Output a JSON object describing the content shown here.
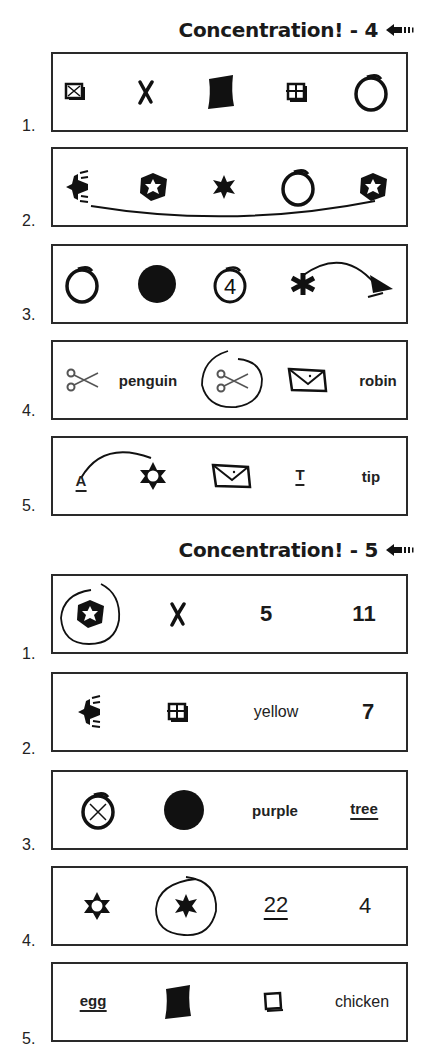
{
  "sections": [
    {
      "title": "Concentration! - 4",
      "arrow_icon": "left-arrow-icon",
      "rows": [
        {
          "number": "1.",
          "items": [
            {
              "type": "icon",
              "name": "crossed-box-icon"
            },
            {
              "type": "icon",
              "name": "x-mark-icon"
            },
            {
              "type": "icon",
              "name": "filled-square-icon"
            },
            {
              "type": "icon",
              "name": "window-grid-icon"
            },
            {
              "type": "icon",
              "name": "open-circle-icon"
            }
          ]
        },
        {
          "number": "2.",
          "items": [
            {
              "type": "icon",
              "name": "airplane-icon"
            },
            {
              "type": "icon",
              "name": "hexagon-star-icon"
            },
            {
              "type": "icon",
              "name": "filled-star-icon"
            },
            {
              "type": "icon",
              "name": "open-circle-icon"
            },
            {
              "type": "icon",
              "name": "hexagon-star-icon"
            }
          ],
          "annotation": "line connecting airplane to hexagon-star"
        },
        {
          "number": "3.",
          "items": [
            {
              "type": "icon",
              "name": "open-circle-icon"
            },
            {
              "type": "icon",
              "name": "filled-circle-icon"
            },
            {
              "type": "text",
              "value": "4",
              "circled": true
            },
            {
              "type": "icon",
              "name": "asterisk-icon"
            },
            {
              "type": "icon",
              "name": "triangle-icon"
            }
          ],
          "annotation": "arrow from asterisk to triangle"
        },
        {
          "number": "4.",
          "items": [
            {
              "type": "icon",
              "name": "scissors-icon"
            },
            {
              "type": "text",
              "value": "penguin"
            },
            {
              "type": "icon",
              "name": "scissors-icon",
              "circled": true
            },
            {
              "type": "icon",
              "name": "envelope-icon"
            },
            {
              "type": "text",
              "value": "robin",
              "struck": "i"
            }
          ]
        },
        {
          "number": "5.",
          "items": [
            {
              "type": "text",
              "value": "A",
              "underlined": true
            },
            {
              "type": "icon",
              "name": "outline-star-icon"
            },
            {
              "type": "icon",
              "name": "envelope-icon"
            },
            {
              "type": "text",
              "value": "T",
              "underlined": true
            },
            {
              "type": "text",
              "value": "tip"
            }
          ],
          "annotation": "arc connecting A to star"
        }
      ]
    },
    {
      "title": "Concentration! - 5",
      "arrow_icon": "left-arrow-icon",
      "rows": [
        {
          "number": "1.",
          "items": [
            {
              "type": "icon",
              "name": "hexagon-star-icon",
              "circled": true
            },
            {
              "type": "icon",
              "name": "x-mark-icon"
            },
            {
              "type": "text",
              "value": "5"
            },
            {
              "type": "text",
              "value": "11"
            }
          ]
        },
        {
          "number": "2.",
          "items": [
            {
              "type": "icon",
              "name": "airplane-icon"
            },
            {
              "type": "icon",
              "name": "window-grid-icon"
            },
            {
              "type": "text",
              "value": "yellow"
            },
            {
              "type": "text",
              "value": "7"
            }
          ]
        },
        {
          "number": "3.",
          "items": [
            {
              "type": "icon",
              "name": "circled-x-icon"
            },
            {
              "type": "icon",
              "name": "filled-circle-icon"
            },
            {
              "type": "text",
              "value": "purple"
            },
            {
              "type": "text",
              "value": "tree",
              "underlined": true
            }
          ]
        },
        {
          "number": "4.",
          "items": [
            {
              "type": "icon",
              "name": "outline-star-icon"
            },
            {
              "type": "icon",
              "name": "filled-star-icon",
              "circled": true
            },
            {
              "type": "text",
              "value": "22",
              "underlined": true
            },
            {
              "type": "text",
              "value": "4"
            }
          ]
        },
        {
          "number": "5.",
          "items": [
            {
              "type": "text",
              "value": "egg",
              "underlined": true
            },
            {
              "type": "icon",
              "name": "filled-square-icon"
            },
            {
              "type": "icon",
              "name": "open-square-icon"
            },
            {
              "type": "text",
              "value": "chicken",
              "struck": "c,c"
            }
          ]
        }
      ]
    }
  ]
}
